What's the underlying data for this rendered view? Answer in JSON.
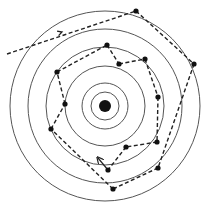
{
  "diagram": {
    "type": "concentric-orbit-trajectory",
    "center": {
      "x": 105,
      "y": 106
    },
    "nucleus_radius": 6,
    "rings": [
      14,
      23,
      40,
      59,
      77,
      95
    ],
    "colors": {
      "ring": "#555555",
      "path": "#222222",
      "node": "#111111",
      "background": "#ffffff"
    },
    "entry": {
      "from": [
        7,
        54
      ],
      "to": [
        136,
        11
      ],
      "arrow_at": [
        62,
        32
      ]
    },
    "nodes": [
      {
        "id": "n1",
        "x": 136,
        "y": 11
      },
      {
        "id": "n2",
        "x": 194,
        "y": 64
      },
      {
        "id": "n3",
        "x": 145,
        "y": 59
      },
      {
        "id": "n4",
        "x": 119,
        "y": 64
      },
      {
        "id": "n5",
        "x": 107,
        "y": 45
      },
      {
        "id": "n6",
        "x": 57,
        "y": 72
      },
      {
        "id": "n7",
        "x": 65,
        "y": 104
      },
      {
        "id": "n8",
        "x": 51,
        "y": 129
      },
      {
        "id": "n9",
        "x": 158,
        "y": 97
      },
      {
        "id": "n10",
        "x": 157,
        "y": 142
      },
      {
        "id": "n11",
        "x": 126,
        "y": 147
      },
      {
        "id": "n12",
        "x": 108,
        "y": 170
      },
      {
        "id": "n13",
        "x": 158,
        "y": 168
      },
      {
        "id": "n14",
        "x": 113,
        "y": 189
      }
    ],
    "edges": [
      [
        "n1",
        "n2"
      ],
      [
        "n2",
        "n13"
      ],
      [
        "n13",
        "n14"
      ],
      [
        "n14",
        "n8"
      ],
      [
        "n8",
        "n7"
      ],
      [
        "n7",
        "n6"
      ],
      [
        "n6",
        "n5"
      ],
      [
        "n5",
        "n4"
      ],
      [
        "n4",
        "n3"
      ],
      [
        "n3",
        "n9"
      ],
      [
        "n9",
        "n10"
      ],
      [
        "n10",
        "n11"
      ],
      [
        "n11",
        "n12"
      ]
    ],
    "exit": {
      "from": [
        108,
        170
      ],
      "to": [
        98,
        158
      ]
    }
  }
}
